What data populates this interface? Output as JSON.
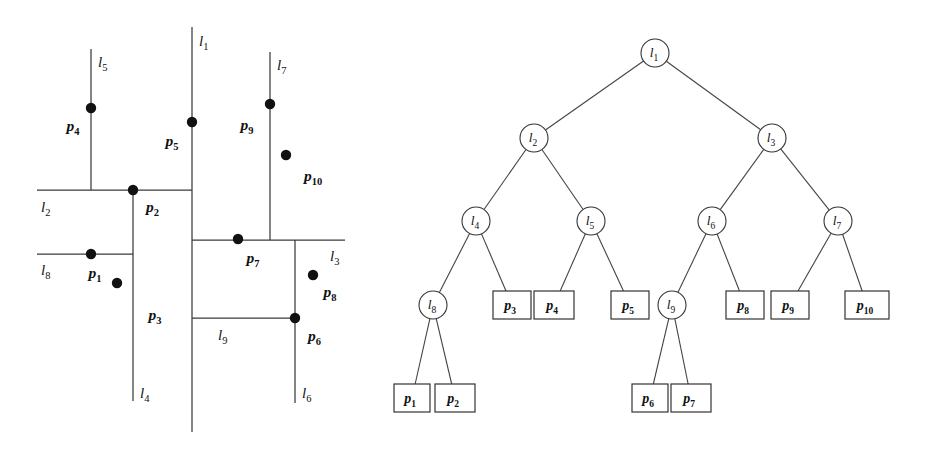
{
  "figure": {
    "stroke_color": "#3a3a3a",
    "point_color": "#111111",
    "background": "#ffffff"
  },
  "subdivision": {
    "caption": "Planar subdivision induced by splitting lines",
    "splitting_lines": [
      {
        "id": "l1",
        "label": "l",
        "sub": "1",
        "orientation": "vertical",
        "x": 192,
        "y1": 27,
        "y2": 432,
        "label_x": 199,
        "label_y": 46
      },
      {
        "id": "l2",
        "label": "l",
        "sub": "2",
        "orientation": "horizontal",
        "y": 190,
        "x1": 37,
        "x2": 192,
        "label_x": 41,
        "label_y": 212
      },
      {
        "id": "l3",
        "label": "l",
        "sub": "3",
        "orientation": "horizontal",
        "y": 240,
        "x1": 192,
        "x2": 345,
        "label_x": 330,
        "label_y": 261
      },
      {
        "id": "l4",
        "label": "l",
        "sub": "4",
        "orientation": "vertical",
        "x": 133,
        "y1": 190,
        "y2": 401,
        "label_x": 140,
        "label_y": 398
      },
      {
        "id": "l5",
        "label": "l",
        "sub": "5",
        "orientation": "vertical",
        "x": 91,
        "y1": 49,
        "y2": 190,
        "label_x": 98,
        "label_y": 67
      },
      {
        "id": "l6",
        "label": "l",
        "sub": "6",
        "orientation": "vertical",
        "x": 295,
        "y1": 240,
        "y2": 403,
        "label_x": 302,
        "label_y": 398
      },
      {
        "id": "l7",
        "label": "l",
        "sub": "7",
        "orientation": "vertical",
        "x": 270,
        "y1": 52,
        "y2": 240,
        "label_x": 277,
        "label_y": 70
      },
      {
        "id": "l8",
        "label": "l",
        "sub": "8",
        "orientation": "horizontal",
        "y": 254,
        "x1": 37,
        "x2": 133,
        "label_x": 41,
        "label_y": 275
      },
      {
        "id": "l9",
        "label": "l",
        "sub": "9",
        "orientation": "horizontal",
        "y": 318,
        "x1": 192,
        "x2": 295,
        "label_x": 218,
        "label_y": 340
      }
    ],
    "points": [
      {
        "id": "p1",
        "label": "p",
        "sub": "1",
        "x": 91,
        "y": 254,
        "label_x": 95,
        "label_y": 278,
        "anchor": "middle"
      },
      {
        "id": "p2",
        "label": "p",
        "sub": "2",
        "x": 133,
        "y": 190,
        "label_x": 146,
        "label_y": 212,
        "anchor": "start"
      },
      {
        "id": "p3",
        "label": "p",
        "sub": "3",
        "x": 117,
        "y": 283,
        "label_x": 155,
        "label_y": 320,
        "anchor": "middle"
      },
      {
        "id": "p4",
        "label": "p",
        "sub": "4",
        "x": 91,
        "y": 108,
        "label_x": 73,
        "label_y": 131,
        "anchor": "middle"
      },
      {
        "id": "p5",
        "label": "p",
        "sub": "5",
        "x": 192,
        "y": 122,
        "label_x": 172,
        "label_y": 146,
        "anchor": "middle"
      },
      {
        "id": "p6",
        "label": "p",
        "sub": "6",
        "x": 295,
        "y": 318,
        "label_x": 308,
        "label_y": 341,
        "anchor": "start"
      },
      {
        "id": "p7",
        "label": "p",
        "sub": "7",
        "x": 238,
        "y": 239,
        "label_x": 253,
        "label_y": 263,
        "anchor": "middle"
      },
      {
        "id": "p8",
        "label": "p",
        "sub": "8",
        "x": 313,
        "y": 275,
        "label_x": 330,
        "label_y": 297,
        "anchor": "middle"
      },
      {
        "id": "p9",
        "label": "p",
        "sub": "9",
        "x": 270,
        "y": 104,
        "label_x": 247,
        "label_y": 130,
        "anchor": "middle"
      },
      {
        "id": "p10",
        "label": "p",
        "sub": "10",
        "x": 286,
        "y": 155,
        "label_x": 313,
        "label_y": 181,
        "anchor": "middle"
      }
    ]
  },
  "tree": {
    "caption": "kd-tree",
    "internal_nodes": [
      {
        "id": "l1",
        "label": "l",
        "sub": "1",
        "cx": 655,
        "cy": 53,
        "r": 14
      },
      {
        "id": "l2",
        "label": "l",
        "sub": "2",
        "cx": 534,
        "cy": 138,
        "r": 14
      },
      {
        "id": "l3",
        "label": "l",
        "sub": "3",
        "cx": 772,
        "cy": 138,
        "r": 14
      },
      {
        "id": "l4",
        "label": "l",
        "sub": "4",
        "cx": 476,
        "cy": 221,
        "r": 14
      },
      {
        "id": "l5",
        "label": "l",
        "sub": "5",
        "cx": 591,
        "cy": 221,
        "r": 14
      },
      {
        "id": "l6",
        "label": "l",
        "sub": "6",
        "cx": 712,
        "cy": 221,
        "r": 14
      },
      {
        "id": "l7",
        "label": "l",
        "sub": "7",
        "cx": 838,
        "cy": 221,
        "r": 14
      },
      {
        "id": "l8",
        "label": "l",
        "sub": "8",
        "cx": 433,
        "cy": 305,
        "r": 14
      },
      {
        "id": "l9",
        "label": "l",
        "sub": "9",
        "cx": 672,
        "cy": 305,
        "r": 14
      }
    ],
    "leaves": [
      {
        "id": "p1",
        "label": "p",
        "sub": "1",
        "cx": 412,
        "cy": 398,
        "w": 36,
        "h": 28
      },
      {
        "id": "p2",
        "label": "p",
        "sub": "2",
        "cx": 455,
        "cy": 398,
        "w": 40,
        "h": 28
      },
      {
        "id": "p3",
        "label": "p",
        "sub": "3",
        "cx": 512,
        "cy": 305,
        "w": 38,
        "h": 28
      },
      {
        "id": "p4",
        "label": "p",
        "sub": "4",
        "cx": 554,
        "cy": 305,
        "w": 40,
        "h": 28
      },
      {
        "id": "p5",
        "label": "p",
        "sub": "5",
        "cx": 630,
        "cy": 305,
        "w": 38,
        "h": 28
      },
      {
        "id": "p6",
        "label": "p",
        "sub": "6",
        "cx": 650,
        "cy": 398,
        "w": 36,
        "h": 28
      },
      {
        "id": "p7",
        "label": "p",
        "sub": "7",
        "cx": 691,
        "cy": 398,
        "w": 40,
        "h": 28
      },
      {
        "id": "p8",
        "label": "p",
        "sub": "8",
        "cx": 745,
        "cy": 305,
        "w": 38,
        "h": 28
      },
      {
        "id": "p9",
        "label": "p",
        "sub": "9",
        "cx": 790,
        "cy": 305,
        "w": 38,
        "h": 28
      },
      {
        "id": "p10",
        "label": "p",
        "sub": "10",
        "cx": 867,
        "cy": 305,
        "w": 44,
        "h": 28
      }
    ],
    "edges": [
      {
        "from": "l1",
        "to": "l2"
      },
      {
        "from": "l1",
        "to": "l3"
      },
      {
        "from": "l2",
        "to": "l4"
      },
      {
        "from": "l2",
        "to": "l5"
      },
      {
        "from": "l3",
        "to": "l6"
      },
      {
        "from": "l3",
        "to": "l7"
      },
      {
        "from": "l4",
        "to": "l8"
      },
      {
        "from": "l4",
        "to": "p3"
      },
      {
        "from": "l5",
        "to": "p4"
      },
      {
        "from": "l5",
        "to": "p5"
      },
      {
        "from": "l6",
        "to": "l9"
      },
      {
        "from": "l6",
        "to": "p8"
      },
      {
        "from": "l7",
        "to": "p9"
      },
      {
        "from": "l7",
        "to": "p10"
      },
      {
        "from": "l8",
        "to": "p1"
      },
      {
        "from": "l8",
        "to": "p2"
      },
      {
        "from": "l9",
        "to": "p6"
      },
      {
        "from": "l9",
        "to": "p7"
      }
    ]
  }
}
